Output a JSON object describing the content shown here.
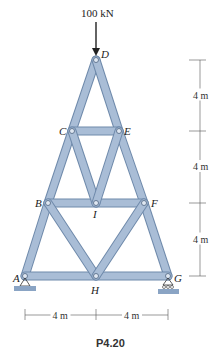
{
  "figure": {
    "caption": "P4.20",
    "load": {
      "label": "100 kN",
      "node": "D"
    },
    "nodes": [
      {
        "id": "D",
        "label": "D",
        "x": 96,
        "y": 60,
        "lx": 101,
        "ly": 58
      },
      {
        "id": "C",
        "label": "C",
        "x": 72,
        "y": 131,
        "lx": 59,
        "ly": 135
      },
      {
        "id": "E",
        "label": "E",
        "x": 119,
        "y": 131,
        "lx": 124,
        "ly": 135
      },
      {
        "id": "B",
        "label": "B",
        "x": 48,
        "y": 203,
        "lx": 35,
        "ly": 207
      },
      {
        "id": "I",
        "label": "I",
        "x": 96,
        "y": 203,
        "lx": 93,
        "ly": 218
      },
      {
        "id": "F",
        "label": "F",
        "x": 144,
        "y": 203,
        "lx": 151,
        "ly": 207
      },
      {
        "id": "A",
        "label": "A",
        "x": 25,
        "y": 276,
        "lx": 13,
        "ly": 282
      },
      {
        "id": "H",
        "label": "H",
        "x": 96,
        "y": 276,
        "lx": 91,
        "ly": 294
      },
      {
        "id": "G",
        "label": "G",
        "x": 168,
        "y": 276,
        "lx": 174,
        "ly": 282
      }
    ],
    "members": [
      [
        "A",
        "B"
      ],
      [
        "B",
        "C"
      ],
      [
        "C",
        "D"
      ],
      [
        "D",
        "E"
      ],
      [
        "E",
        "F"
      ],
      [
        "F",
        "G"
      ],
      [
        "C",
        "E"
      ],
      [
        "B",
        "F"
      ],
      [
        "A",
        "G"
      ],
      [
        "C",
        "I"
      ],
      [
        "I",
        "E"
      ],
      [
        "B",
        "H"
      ],
      [
        "H",
        "F"
      ]
    ],
    "dimensions": {
      "vertical": [
        "4 m",
        "4 m",
        "4 m"
      ],
      "horizontal": [
        "4 m",
        "4 m"
      ]
    },
    "colors": {
      "member": "#a9bdd6",
      "member_edge": "#6f8aab",
      "support": "#8aa4c4"
    }
  }
}
